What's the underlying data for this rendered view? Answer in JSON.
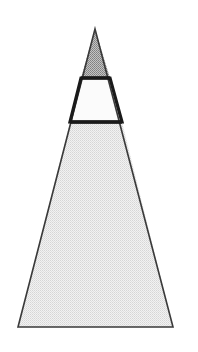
{
  "document": {
    "title": "Segmented Triangle Figure",
    "background_color": "#ffffff",
    "width": 198,
    "height": 352
  },
  "figure": {
    "name": "segmented-triangle",
    "apex": {
      "x": 95,
      "y": 29
    },
    "base_left": {
      "x": 18,
      "y": 327
    },
    "base_right": {
      "x": 173,
      "y": 327
    },
    "outline_color": "#3a3a3a",
    "outline_width": 1.6,
    "divider_color": "#1a1a1a",
    "divider_width": 3.2,
    "cut_lines": [
      {
        "name": "upper-cut",
        "y": 78,
        "left_x": 81,
        "right_x": 110
      },
      {
        "name": "lower-cut",
        "y": 122,
        "left_x": 70,
        "right_x": 122
      }
    ],
    "bands": [
      {
        "id": "apex-band",
        "label": "Top shaded triangle",
        "shape": "triangle",
        "fill_color": "#a8a8a8",
        "fill_style": "dense-stipple",
        "points": "95,29 110,78 81,78"
      },
      {
        "id": "middle-band",
        "label": "Middle white trapezoid",
        "shape": "trapezoid",
        "fill_color": "#fbfbfb",
        "fill_style": "plain",
        "points": "81,78 110,78 122,122 70,122"
      },
      {
        "id": "base-band",
        "label": "Bottom light shaded trapezoid",
        "shape": "trapezoid",
        "fill_color": "#e2e2e2",
        "fill_style": "light-stipple",
        "points": "70,122 122,122 173,327 18,327"
      }
    ]
  }
}
